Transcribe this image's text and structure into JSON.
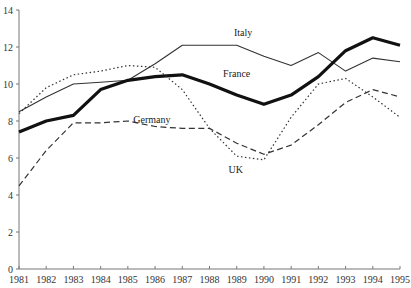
{
  "chart_data": {
    "type": "line",
    "title": "",
    "xlabel": "",
    "ylabel": "",
    "x": [
      1981,
      1982,
      1983,
      1984,
      1985,
      1986,
      1987,
      1988,
      1989,
      1990,
      1991,
      1992,
      1993,
      1994,
      1995
    ],
    "ylim": [
      0,
      14
    ],
    "yticks": [
      0,
      2,
      4,
      6,
      8,
      10,
      12,
      14
    ],
    "grid": false,
    "legend": "inline labels",
    "series": [
      {
        "name": "Italy",
        "style": "thin-solid",
        "values": [
          8.5,
          9.3,
          10.0,
          10.1,
          10.2,
          11.1,
          12.1,
          12.1,
          12.1,
          11.5,
          11.0,
          11.7,
          10.7,
          11.4,
          11.2
        ],
        "label_pos": [
          1988.9,
          12.6
        ]
      },
      {
        "name": "France",
        "style": "thick-solid",
        "values": [
          7.4,
          8.0,
          8.3,
          9.7,
          10.2,
          10.4,
          10.5,
          10.0,
          9.4,
          8.9,
          9.4,
          10.4,
          11.8,
          12.5,
          12.1
        ],
        "label_pos": [
          1988.5,
          10.4
        ]
      },
      {
        "name": "Germany",
        "style": "dashed",
        "values": [
          4.5,
          6.4,
          7.9,
          7.9,
          8.0,
          7.7,
          7.6,
          7.6,
          6.8,
          6.2,
          6.7,
          7.8,
          9.0,
          9.7,
          9.3
        ],
        "label_pos": [
          1985.2,
          7.9
        ]
      },
      {
        "name": "UK",
        "style": "dotted",
        "values": [
          8.4,
          9.8,
          10.5,
          10.7,
          11.0,
          10.9,
          9.7,
          7.6,
          6.1,
          5.9,
          8.2,
          10.0,
          10.3,
          9.3,
          8.2
        ],
        "label_pos": [
          1988.7,
          5.2
        ]
      }
    ]
  }
}
